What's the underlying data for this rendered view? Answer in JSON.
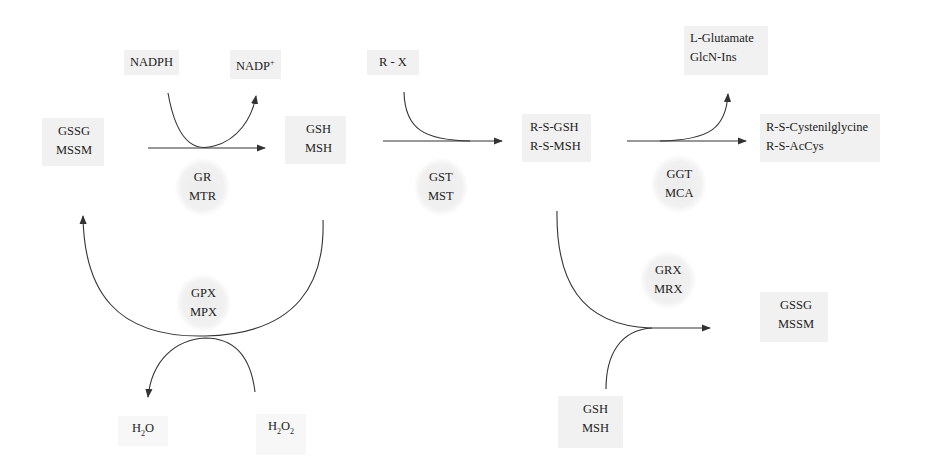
{
  "diagram": {
    "colors": {
      "box_fill": "#f1f1f1",
      "line": "#333333",
      "text": "#222222"
    },
    "nodes": {
      "nadph": "NADPH",
      "nadp_plus": {
        "base": "NADP",
        "sup": "+"
      },
      "gssg_mssm_left": [
        "GSSG",
        "MSSM"
      ],
      "gsh_msh_top": [
        "GSH",
        "MSH"
      ],
      "r_x": "R - X",
      "rs_gsh_msh": [
        "R-S-GSH",
        "R-S-MSH"
      ],
      "lglutamate_glcnins": [
        "L-Glutamate",
        "GlcN-Ins"
      ],
      "rs_cys_accys": [
        "R-S-Cystenilglycine",
        "R-S-AcCys"
      ],
      "gssg_mssm_right": [
        "GSSG",
        "MSSM"
      ],
      "gsh_msh_bottom": [
        "GSH",
        "MSH"
      ],
      "h2o": {
        "a": "H",
        "sub": "2",
        "b": "O"
      },
      "h2o2": {
        "a": "H",
        "sub1": "2",
        "b": "O",
        "sub2": "2"
      }
    },
    "enzymes": {
      "gr_mtr": [
        "GR",
        "MTR"
      ],
      "gst_mst": [
        "GST",
        "MST"
      ],
      "ggt_mca": [
        "GGT",
        "MCA"
      ],
      "gpx_mpx": [
        "GPX",
        "MPX"
      ],
      "grx_mrx": [
        "GRX",
        "MRX"
      ]
    },
    "edges": [
      {
        "from": "GSSG/MSSM",
        "to": "GSH/MSH",
        "enzyme": "GR/MTR",
        "cofactor_in": "NADPH",
        "cofactor_out": "NADP+"
      },
      {
        "from": "GSH/MSH",
        "to": "R-S-GSH/R-S-MSH",
        "enzyme": "GST/MST",
        "cosubstrate": "R - X"
      },
      {
        "from": "R-S-GSH/R-S-MSH",
        "to": "R-S-Cystenilglycine/R-S-AcCys",
        "enzyme": "GGT/MCA",
        "byproduct": "L-Glutamate/GlcN-Ins"
      },
      {
        "from": "GSH/MSH",
        "to": "GSSG/MSSM",
        "enzyme": "GPX/MPX",
        "cosubstrate_in": "H2O2",
        "byproduct": "H2O"
      },
      {
        "from": "R-S-GSH/R-S-MSH",
        "to": "GSSG/MSSM",
        "enzyme": "GRX/MRX",
        "cosubstrate": "GSH/MSH"
      }
    ]
  }
}
